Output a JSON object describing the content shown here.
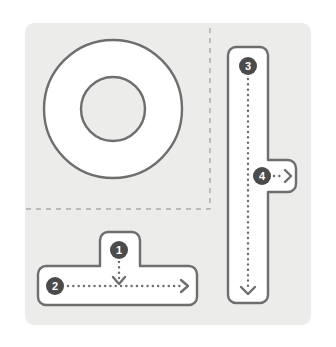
{
  "figure": {
    "type": "assembly-diagram",
    "background_color": "#ececea",
    "panel": {
      "x": 25,
      "y": 23,
      "width": 286,
      "height": 302,
      "corner_radius": 9
    },
    "stroke_color": "#6e6e6e",
    "shape_fill": "#ffffff",
    "badge_fill": "#4b4b4b",
    "badge_text_color": "#ffffff",
    "dash_color": "#a9a9a7"
  },
  "guides": {
    "vertical_dashed": {
      "x": 210,
      "y1": 28,
      "y2": 209
    },
    "horizontal_dashed": {
      "y": 209,
      "x1": 26,
      "x2": 210
    }
  },
  "shapes": [
    {
      "name": "washer-ring",
      "kind": "annulus",
      "cx": 113,
      "cy": 109,
      "outer_radius": 69,
      "inner_radius": 32
    },
    {
      "name": "tee-bracket-bottom",
      "kind": "tee",
      "orientation": "stem-up",
      "stem": {
        "x": 100,
        "y": 232,
        "width": 40,
        "height": 36
      },
      "bar": {
        "x": 38,
        "y": 266,
        "width": 159,
        "height": 39
      },
      "corner_radius": 8
    },
    {
      "name": "tee-bracket-right",
      "kind": "tee",
      "orientation": "stem-right",
      "bar": {
        "x": 228,
        "y": 47,
        "width": 40,
        "height": 256
      },
      "stem": {
        "x": 268,
        "y": 160,
        "width": 28,
        "height": 32
      },
      "corner_radius": 8
    }
  ],
  "callouts": [
    {
      "id": "1",
      "label": "1",
      "badge": {
        "cx": 119,
        "cy": 250,
        "r": 9
      },
      "arrow": {
        "direction": "down",
        "from_x": 119,
        "from_y": 261,
        "to_x": 119,
        "to_y": 283
      }
    },
    {
      "id": "2",
      "label": "2",
      "badge": {
        "cx": 55,
        "cy": 286,
        "r": 9
      },
      "arrow": {
        "direction": "right",
        "from_x": 67,
        "from_y": 286,
        "to_x": 188,
        "to_y": 286
      }
    },
    {
      "id": "3",
      "label": "3",
      "badge": {
        "cx": 248,
        "cy": 66,
        "r": 9
      },
      "arrow": {
        "direction": "down",
        "from_x": 248,
        "from_y": 78,
        "to_x": 248,
        "to_y": 293
      }
    },
    {
      "id": "4",
      "label": "4",
      "badge": {
        "cx": 262,
        "cy": 176,
        "r": 9
      },
      "arrow": {
        "direction": "right",
        "from_x": 273,
        "from_y": 176,
        "to_x": 291,
        "to_y": 176
      }
    }
  ]
}
